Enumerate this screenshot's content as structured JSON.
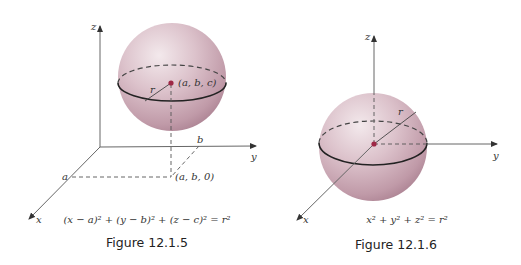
{
  "figures": [
    {
      "id": "fig1",
      "caption": "Figure 12.1.5",
      "equation": "(x − a)² + (y − b)² + (z − c)² = r²",
      "labels": {
        "x_axis": "x",
        "y_axis": "y",
        "z_axis": "z",
        "center": "(a, b, c)",
        "projection": "(a, b, 0)",
        "a_mark": "a",
        "b_mark": "b",
        "radius": "r"
      }
    },
    {
      "id": "fig2",
      "caption": "Figure 12.1.6",
      "equation": "x² + y² + z² = r²",
      "labels": {
        "x_axis": "x",
        "y_axis": "y",
        "z_axis": "z",
        "radius": "r"
      }
    }
  ],
  "colors": {
    "sphere_highlight": "#f1e6ea",
    "sphere_mid": "#d6bac4",
    "sphere_edge": "#b08797",
    "center_dot": "#9e2846"
  }
}
